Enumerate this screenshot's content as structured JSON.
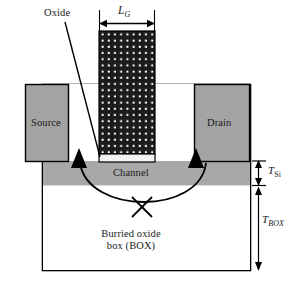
{
  "figure": {
    "type": "device-cross-section",
    "colors": {
      "metal_gray": "#a3a3a3",
      "silicon_gray": "#a8a8a8",
      "gate_fill": "#1c1c1c",
      "gate_dot": "#ffffff",
      "oxide_fill": "#f2f2f2",
      "outline": "#000000",
      "background": "#ffffff",
      "text": "#1a1a1a"
    },
    "labels": {
      "oxide": "Oxide",
      "gate_length": "L",
      "gate_length_sub": "G",
      "source": "Source",
      "drain": "Drain",
      "channel": "Channel",
      "buried_oxide_line1": "Burried oxide",
      "buried_oxide_line2": "box (BOX)",
      "t_si": "T",
      "t_si_sub": "Si",
      "t_box": "T",
      "t_box_sub": "BOX"
    },
    "annotations": {
      "leakage_path": "blocked-path-cross",
      "leader_target": "gate-oxide-layer",
      "dimension_lg": "gate length horizontal dimension",
      "dimension_tsi": "silicon body thickness vertical dimension",
      "dimension_tbox": "buried oxide thickness vertical dimension"
    }
  }
}
